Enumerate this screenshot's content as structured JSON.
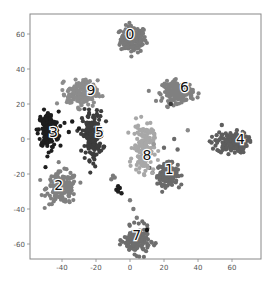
{
  "chart_data": {
    "type": "scatter",
    "title": "",
    "xlabel": "",
    "ylabel": "",
    "xlim": [
      -58,
      77
    ],
    "ylim": [
      -69,
      72
    ],
    "grid": false,
    "legend": "none",
    "x_ticks": [
      -40,
      -20,
      0,
      20,
      40,
      60
    ],
    "y_ticks": [
      60,
      40,
      20,
      0,
      -20,
      -40,
      -60
    ],
    "x_tick_labels": [
      "-40",
      "-20",
      "0",
      "20",
      "40",
      "60"
    ],
    "y_tick_labels": [
      "60",
      "40",
      "20",
      "0",
      "-20",
      "-40",
      "-60"
    ],
    "clusters": [
      {
        "label": "0",
        "center": [
          2,
          57
        ],
        "spread": [
          5,
          5
        ],
        "color": "#7a7a7a",
        "label_pos": [
          0,
          60
        ]
      },
      {
        "label": "1",
        "center": [
          22,
          -20
        ],
        "spread": [
          4,
          4
        ],
        "color": "#6a6a6a",
        "label_pos": [
          23,
          -17
        ]
      },
      {
        "label": "2",
        "center": [
          -40,
          -28
        ],
        "spread": [
          6,
          6
        ],
        "color": "#808080",
        "label_pos": [
          -42,
          -26
        ]
      },
      {
        "label": "3",
        "center": [
          -48,
          5
        ],
        "spread": [
          4,
          7
        ],
        "color": "#1e1e1e",
        "label_pos": [
          -45,
          4
        ]
      },
      {
        "label": "4",
        "center": [
          60,
          -2
        ],
        "spread": [
          6,
          4
        ],
        "color": "#5e5e5e",
        "label_pos": [
          65,
          0
        ]
      },
      {
        "label": "5",
        "center": [
          -22,
          2
        ],
        "spread": [
          4,
          9
        ],
        "color": "#3c3c3c",
        "label_pos": [
          -18,
          4
        ]
      },
      {
        "label": "6",
        "center": [
          28,
          27
        ],
        "spread": [
          6,
          4
        ],
        "color": "#808080",
        "label_pos": [
          32,
          30
        ]
      },
      {
        "label": "7",
        "center": [
          4,
          -58
        ],
        "spread": [
          5,
          5
        ],
        "color": "#6e6e6e",
        "label_pos": [
          4,
          -55
        ]
      },
      {
        "label": "8",
        "center": [
          8,
          -5
        ],
        "spread": [
          4,
          9
        ],
        "color": "#a8a8a8",
        "label_pos": [
          10,
          -9
        ]
      },
      {
        "label": "9",
        "center": [
          -28,
          26
        ],
        "spread": [
          6,
          5
        ],
        "color": "#8c8c8c",
        "label_pos": [
          -23,
          28
        ]
      }
    ],
    "extra_points": [
      {
        "x": -8,
        "y": -29,
        "color": "#1e1e1e"
      },
      {
        "x": -6,
        "y": -28,
        "color": "#1e1e1e"
      },
      {
        "x": -7,
        "y": -30,
        "color": "#1e1e1e"
      },
      {
        "x": -7,
        "y": -27,
        "color": "#1e1e1e"
      },
      {
        "x": -5,
        "y": -31,
        "color": "#1e1e1e"
      },
      {
        "x": -10,
        "y": -21,
        "color": "#7a7a7a"
      },
      {
        "x": -9,
        "y": -22,
        "color": "#7a7a7a"
      },
      {
        "x": -11,
        "y": -23,
        "color": "#7a7a7a"
      },
      {
        "x": 10,
        "y": -52,
        "color": "#111111"
      },
      {
        "x": 14,
        "y": -3,
        "color": "#9a9a9a"
      },
      {
        "x": 20,
        "y": -5,
        "color": "#6a6a6a"
      },
      {
        "x": 26,
        "y": 0,
        "color": "#6a6a6a"
      },
      {
        "x": 28,
        "y": -6,
        "color": "#6a6a6a"
      },
      {
        "x": 34,
        "y": 5,
        "color": "#8a8a8a"
      },
      {
        "x": 54,
        "y": 8,
        "color": "#5e5e5e"
      },
      {
        "x": 48,
        "y": -2,
        "color": "#5e5e5e"
      },
      {
        "x": 2,
        "y": -40,
        "color": "#7a7a7a"
      },
      {
        "x": 4,
        "y": -45,
        "color": "#7a7a7a"
      },
      {
        "x": 0,
        "y": -35,
        "color": "#7a7a7a"
      },
      {
        "x": -34,
        "y": 10,
        "color": "#1e1e1e"
      },
      {
        "x": -30,
        "y": 6,
        "color": "#1e1e1e"
      },
      {
        "x": -36,
        "y": 4,
        "color": "#1e1e1e"
      },
      {
        "x": 24,
        "y": 20,
        "color": "#3c3c3c"
      }
    ]
  },
  "axes": {
    "frame_color": "#888888"
  }
}
